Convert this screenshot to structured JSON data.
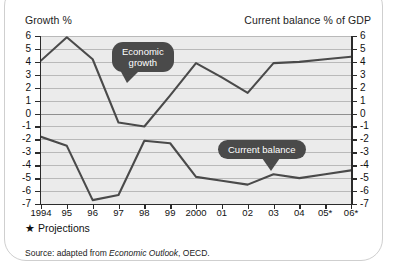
{
  "header": {
    "left_title": "Growth %",
    "right_title": "Current balance % of GDP"
  },
  "footer": {
    "projection_note": "★ Projections",
    "source_prefix": "Source: adapted from ",
    "source_italic": "Economic Outlook",
    "source_suffix": ", OECD."
  },
  "callouts": {
    "growth": "Economic\ngrowth",
    "growth_line1": "Economic",
    "growth_line2": "growth",
    "balance": "Current balance"
  },
  "colors": {
    "line": "#4a4a4a",
    "plot_bg": "#ebebeb",
    "grid": "#b9b9b9",
    "axis": "#2b2b2b",
    "callout_bg": "#4a4a4a"
  },
  "chart_data": {
    "type": "line",
    "title": "",
    "xlabel": "",
    "ylabel": "Growth %",
    "y2label": "Current balance % of GDP",
    "grid": true,
    "legend": "callout-annotations",
    "categories": [
      "1994",
      "95",
      "96",
      "97",
      "98",
      "99",
      "2000",
      "01",
      "02",
      "03",
      "04",
      "05*",
      "06*"
    ],
    "yticks": [
      6,
      5,
      4,
      3,
      2,
      1,
      0,
      -1,
      -2,
      -3,
      -4,
      -5,
      -6,
      -7
    ],
    "ylim": [
      -7,
      6
    ],
    "y2ticks": [
      6,
      5,
      4,
      3,
      2,
      1,
      0,
      -1,
      -2,
      -3,
      -4,
      -5,
      -6,
      -7
    ],
    "y2lim": [
      -7,
      6
    ],
    "series": [
      {
        "name": "Economic growth",
        "axis": "left",
        "values": [
          4.1,
          5.9,
          4.2,
          -0.7,
          -1.0,
          1.4,
          3.9,
          2.8,
          1.6,
          3.9,
          4.0,
          4.2,
          4.4
        ]
      },
      {
        "name": "Current balance",
        "axis": "right",
        "values": [
          -1.8,
          -2.5,
          -6.7,
          -6.3,
          -2.1,
          -2.3,
          -4.9,
          -5.2,
          -5.5,
          -4.7,
          -5.0,
          -4.7,
          -4.4
        ]
      }
    ],
    "annotations": [
      {
        "text": "Economic growth",
        "points_to_series": "Economic growth"
      },
      {
        "text": "Current balance",
        "points_to_series": "Current balance"
      }
    ]
  }
}
